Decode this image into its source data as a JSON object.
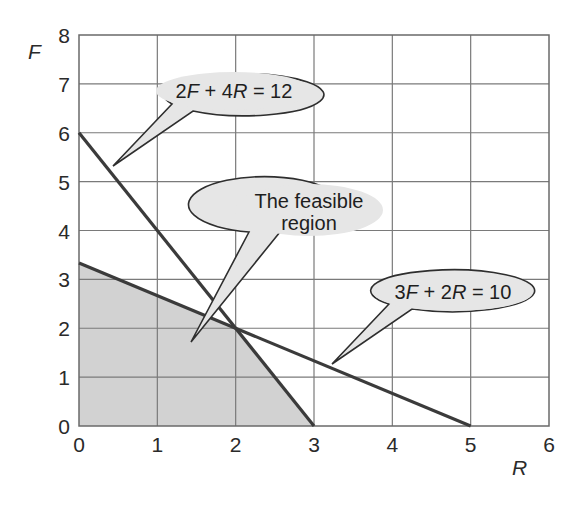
{
  "chart_data": {
    "type": "line",
    "title": "",
    "xlabel": "R",
    "ylabel": "F",
    "xlim": [
      0,
      6
    ],
    "ylim": [
      0,
      8
    ],
    "grid": true,
    "x_ticks": [
      "0",
      "1",
      "2",
      "3",
      "4",
      "5",
      "6"
    ],
    "y_ticks": [
      "0",
      "1",
      "2",
      "3",
      "4",
      "5",
      "6",
      "7",
      "8"
    ],
    "series": [
      {
        "name": "2F + 4R = 12",
        "points": [
          [
            0,
            6
          ],
          [
            3,
            0
          ]
        ],
        "color": "#3b3b3b"
      },
      {
        "name": "3F + 2R = 10",
        "points": [
          [
            0,
            3.333
          ],
          [
            5,
            0
          ]
        ],
        "color": "#3b3b3b"
      }
    ],
    "feasible_region": {
      "label": "The feasible region",
      "vertices": [
        [
          0,
          0
        ],
        [
          0,
          3.333
        ],
        [
          2,
          2
        ],
        [
          3,
          0
        ]
      ],
      "fill": "#d2d2d2"
    },
    "annotations": [
      {
        "id": "c1",
        "text_parts": [
          [
            "2",
            false
          ],
          [
            "F",
            true
          ],
          [
            " + 4",
            false
          ],
          [
            "R",
            true
          ],
          [
            " = 12",
            false
          ]
        ],
        "plain": "2F + 4R = 12",
        "points_to": [
          0.44,
          5.28
        ]
      },
      {
        "id": "c2",
        "lines": [
          "The feasible",
          "region"
        ],
        "plain": "The feasible region",
        "points_to": [
          1.43,
          1.72
        ]
      },
      {
        "id": "c3",
        "text_parts": [
          [
            "3",
            false
          ],
          [
            "F",
            true
          ],
          [
            " + 2",
            false
          ],
          [
            "R",
            true
          ],
          [
            " = 10",
            false
          ]
        ],
        "plain": "3F + 2R = 10",
        "points_to": [
          3.23,
          1.27
        ]
      }
    ]
  },
  "labels": {
    "x_axis": "R",
    "y_axis": "F",
    "callout_1": {
      "a": "2",
      "b": "F",
      "c": " + 4",
      "d": "R",
      "e": " = 12"
    },
    "callout_2": {
      "line1": "The feasible",
      "line2": "region"
    },
    "callout_3": {
      "a": "3",
      "b": "F",
      "c": " + 2",
      "d": "R",
      "e": " = 10"
    }
  }
}
